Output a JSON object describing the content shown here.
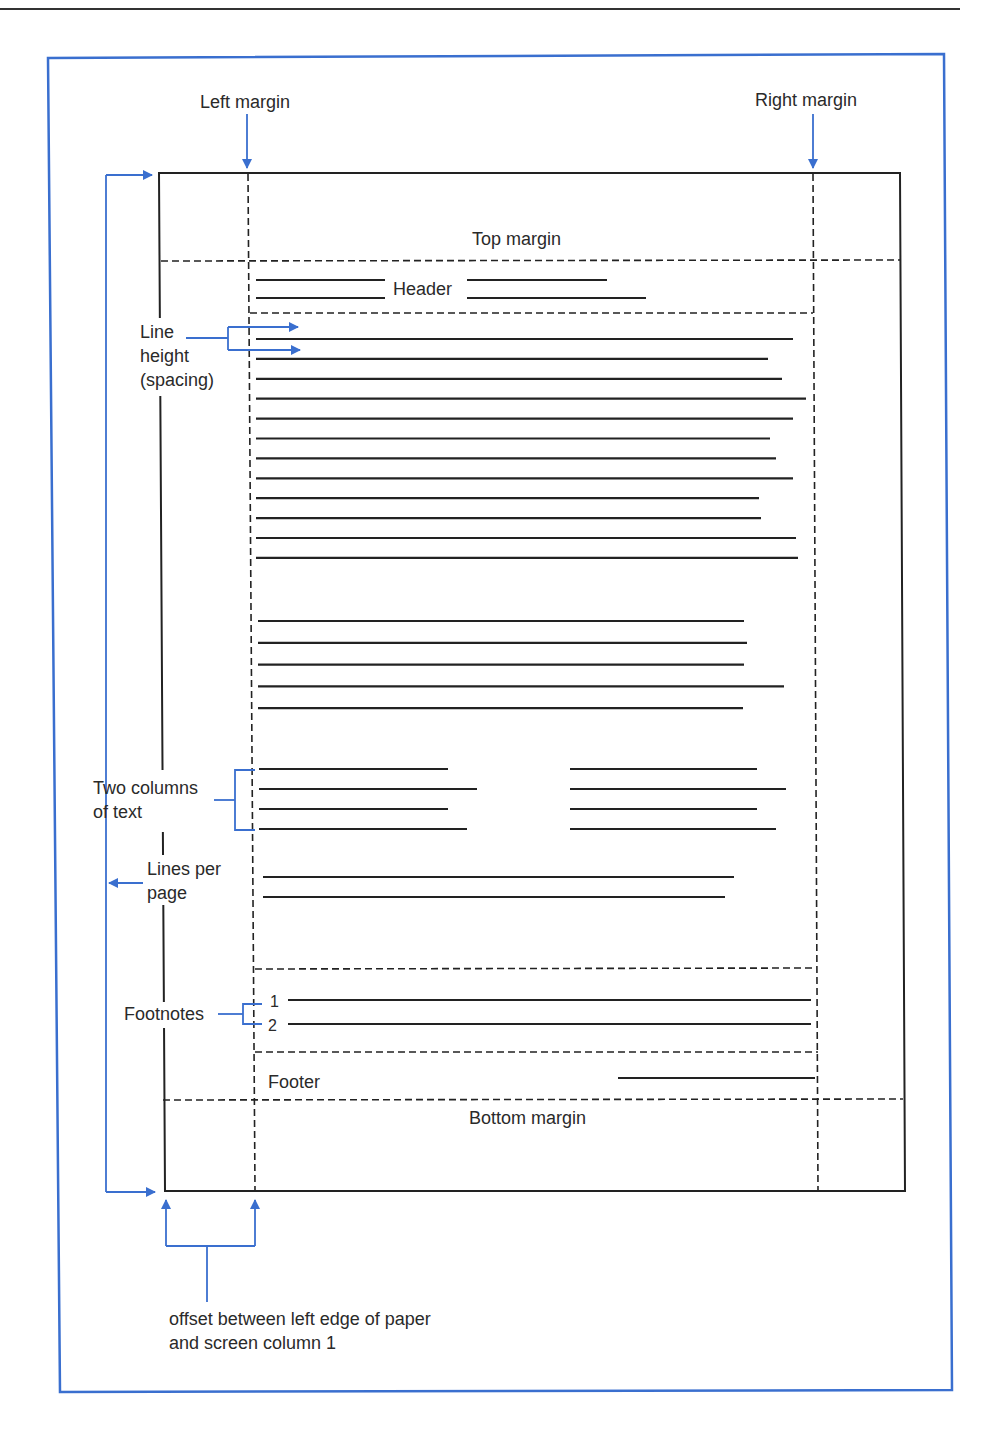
{
  "colors": {
    "accent_blue": "#3a6fcf",
    "ink": "#222222",
    "frame": "#3a6fcf"
  },
  "labels": {
    "left_margin": "Left margin",
    "right_margin": "Right margin",
    "top_margin": "Top margin",
    "header": "Header",
    "line_height_1": "Line",
    "line_height_2": "height",
    "line_height_3": "(spacing)",
    "two_columns_1": "Two columns",
    "two_columns_2": "of text",
    "lines_per_page_1": "Lines per",
    "lines_per_page_2": "page",
    "footnotes": "Footnotes",
    "footnote_1": "1",
    "footnote_2": "2",
    "footer": "Footer",
    "bottom_margin": "Bottom margin",
    "offset_1": "offset between left edge of paper",
    "offset_2": "and screen column 1"
  },
  "body_text_lines_block1": [
    793,
    768,
    782,
    806,
    793,
    770,
    776,
    793,
    759,
    761,
    796,
    798
  ],
  "body_text_lines_block2": [
    744,
    747,
    744,
    784,
    743
  ],
  "two_column_left": [
    448,
    477,
    448,
    467
  ],
  "two_column_right": [
    757,
    786,
    757,
    776
  ],
  "body_text_lines_block3": [
    734,
    725
  ]
}
